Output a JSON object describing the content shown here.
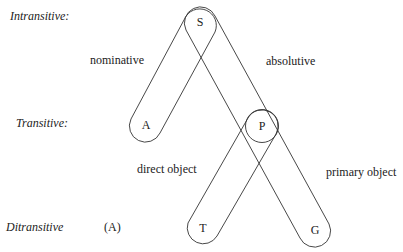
{
  "rows": {
    "intransitive": "Intransitive:",
    "transitive": "Transitive:",
    "ditransitive": "Ditransitive",
    "ditransitive_marker": "(A)"
  },
  "nodes": {
    "S": "S",
    "A": "A",
    "P": "P",
    "T": "T",
    "G": "G"
  },
  "groupings": {
    "nominative": "nominative",
    "absolutive": "absolutive",
    "direct_object": "direct object",
    "primary_object": "primary object"
  },
  "colors": {
    "line": "#333333",
    "text": "#222222",
    "background": "#ffffff"
  }
}
